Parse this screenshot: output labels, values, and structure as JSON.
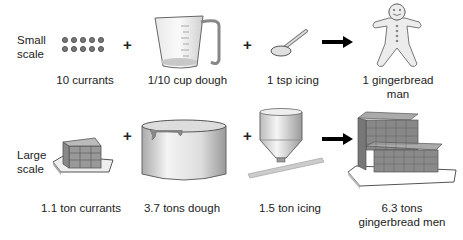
{
  "rows": [
    {
      "label_line1": "Small",
      "label_line2": "scale",
      "items": [
        {
          "name": "currants",
          "caption": "10 currants"
        },
        {
          "name": "dough",
          "caption": "1/10 cup dough"
        },
        {
          "name": "icing",
          "caption": "1 tsp icing"
        }
      ],
      "result": {
        "line1": "1 gingerbread",
        "line2": "man"
      }
    },
    {
      "label_line1": "Large",
      "label_line2": "scale",
      "items": [
        {
          "name": "currants",
          "caption": "1.1 ton currants"
        },
        {
          "name": "dough",
          "caption": "3.7 tons dough"
        },
        {
          "name": "icing",
          "caption": "1.5 ton icing"
        }
      ],
      "result": {
        "line1": "6.3 tons",
        "line2": "gingerbread men"
      }
    }
  ],
  "symbols": {
    "plus": "+",
    "arrow": "yields"
  }
}
